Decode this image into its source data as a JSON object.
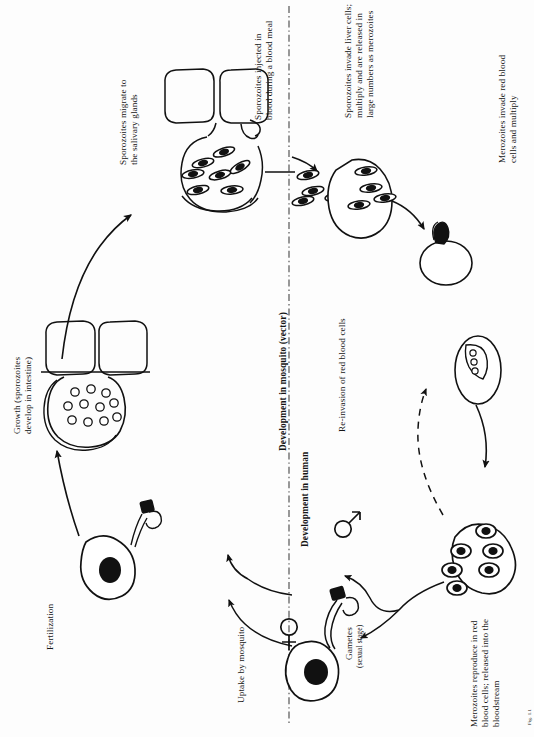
{
  "figure": {
    "orientation": "rotated-90-ccw",
    "background_color": "#fdfdfd",
    "ink_color": "#111111",
    "caption": "Fig. 1.1"
  },
  "section_labels": {
    "mosquito": "Development in mosquito (vector)",
    "human": "Development in human"
  },
  "labels": {
    "salivary": "Sporozoites migrate to\nthe salivary glands",
    "injected": "Sporozoites injected in\nblood during a blood meal",
    "liver": "Sporozoites invade liver cells;\nmultiply and are released in\nlarge numbers as merozoites",
    "invade_rbc": "Merozoites invade red blood\ncells and multiply",
    "reinvasion": "Re-invasion of red blood cells",
    "reproduce": "Merozoites reproduce in red\nblood cells; released into the\nbloodstream",
    "gametes": "Gametes",
    "gametes_sub": "(sexual stage)",
    "uptake": "Uptake by mosquito",
    "fertilization": "Fertilization",
    "growth": "Growth (sporozoites\ndevelop in intestine)"
  },
  "symbols": {
    "female": "♀",
    "male": "♂"
  },
  "stages": [
    {
      "name": "salivary-glands",
      "description": "mosquito salivary gland with sporozoites"
    },
    {
      "name": "liver-cell",
      "description": "liver cell releasing merozoites"
    },
    {
      "name": "red-blood-cell",
      "description": "red blood cell invaded by merozoite"
    },
    {
      "name": "schizont",
      "description": "schizont inside red blood cell"
    },
    {
      "name": "merozoite-cluster",
      "description": "merozoites released into bloodstream"
    },
    {
      "name": "female-gamete",
      "description": "female gamete (macrogamete)"
    },
    {
      "name": "male-gamete",
      "description": "male gamete (microgamete) with flagellum"
    },
    {
      "name": "zygote",
      "description": "fertilized zygote / ookinete"
    },
    {
      "name": "oocyst",
      "description": "oocyst on intestinal wall with developing sporozoites"
    }
  ]
}
